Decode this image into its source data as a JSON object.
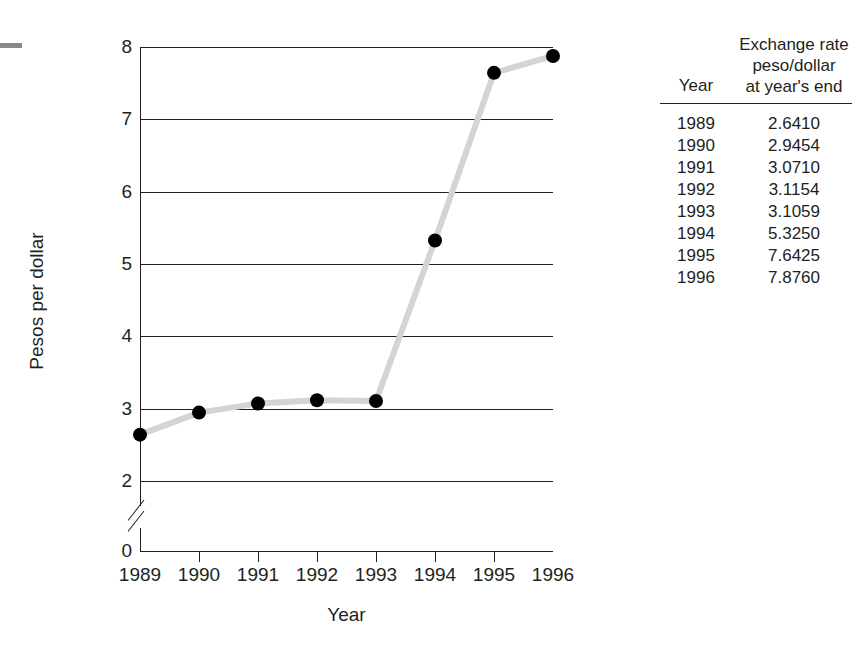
{
  "chart_data": {
    "type": "line",
    "title": "",
    "xlabel": "Year",
    "ylabel": "Pesos per dollar",
    "categories": [
      "1989",
      "1990",
      "1991",
      "1992",
      "1993",
      "1994",
      "1995",
      "1996"
    ],
    "values": [
      2.641,
      2.9454,
      3.071,
      3.1154,
      3.1059,
      5.325,
      7.6425,
      7.876
    ],
    "series": [
      {
        "name": "Exchange rate peso/dollar at year's end",
        "values": [
          2.641,
          2.9454,
          3.071,
          3.1154,
          3.1059,
          5.325,
          7.6425,
          7.876
        ]
      }
    ],
    "ylim": [
      0,
      8
    ],
    "y_ticks": [
      "0",
      "2",
      "3",
      "4",
      "5",
      "6",
      "7",
      "8"
    ],
    "y_tick_values": [
      0,
      2,
      3,
      4,
      5,
      6,
      7,
      8
    ],
    "x_ticks": [
      "1989",
      "1990",
      "1991",
      "1992",
      "1993",
      "1994",
      "1995",
      "1996"
    ],
    "axis_break": true,
    "axis_break_between": [
      0,
      2
    ],
    "grid": "horizontal",
    "legend": "none",
    "line_color": "#d4d4d4",
    "marker_color": "#000000",
    "axis_color": "#231f20"
  },
  "chart": {
    "y_axis_title": "Pesos per dollar",
    "x_axis_title": "Year",
    "y_tick_labels": [
      "8",
      "7",
      "6",
      "5",
      "4",
      "3",
      "2",
      "0"
    ],
    "x_tick_labels": [
      "1989",
      "1990",
      "1991",
      "1992",
      "1993",
      "1994",
      "1995",
      "1996"
    ]
  },
  "table": {
    "header": {
      "year": "Year",
      "rate_line1": "Exchange rate",
      "rate_line2": "peso/dollar",
      "rate_line3": "at year's end"
    },
    "rows": [
      {
        "year": "1989",
        "rate": "2.6410"
      },
      {
        "year": "1990",
        "rate": "2.9454"
      },
      {
        "year": "1991",
        "rate": "3.0710"
      },
      {
        "year": "1992",
        "rate": "3.1154"
      },
      {
        "year": "1993",
        "rate": "3.1059"
      },
      {
        "year": "1994",
        "rate": "5.3250"
      },
      {
        "year": "1995",
        "rate": "7.6425"
      },
      {
        "year": "1996",
        "rate": "7.8760"
      }
    ]
  }
}
